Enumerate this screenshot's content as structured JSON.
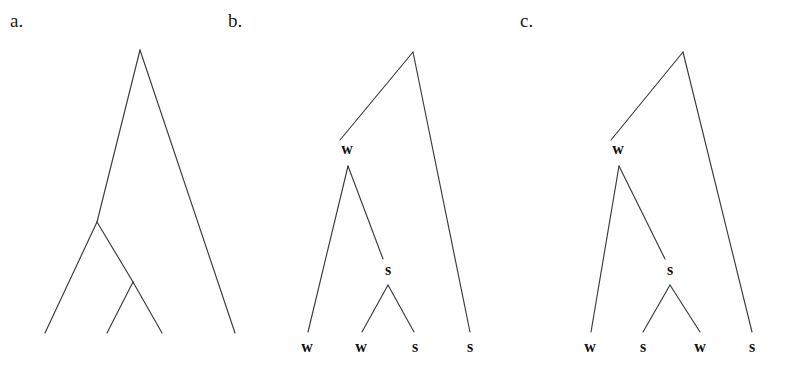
{
  "figure": {
    "background_color": "#ffffff",
    "line_color": "#3a3a3a",
    "text_color": "#111111",
    "panels": [
      {
        "id": "a",
        "label": "a.",
        "label_x": 10,
        "label_y": 27,
        "description": "unlabeled cladogram with four leaf tips",
        "nodes": [
          {
            "name": "root",
            "x": 140,
            "y": 50,
            "label": ""
          },
          {
            "name": "internal-left",
            "x": 97,
            "y": 222,
            "label": ""
          },
          {
            "name": "internal-lower",
            "x": 133,
            "y": 282,
            "label": ""
          }
        ],
        "leaves": [
          {
            "name": "leaf-1",
            "x": 45,
            "y": 333,
            "label": ""
          },
          {
            "name": "leaf-2",
            "x": 107,
            "y": 333,
            "label": ""
          },
          {
            "name": "leaf-3",
            "x": 162,
            "y": 333,
            "label": ""
          },
          {
            "name": "leaf-4",
            "x": 235,
            "y": 333,
            "label": ""
          }
        ],
        "branches": [
          {
            "name": "root-to-internal-left",
            "x1": 140,
            "y1": 50,
            "x2": 97,
            "y2": 222
          },
          {
            "name": "root-to-leaf-4",
            "x1": 140,
            "y1": 50,
            "x2": 235,
            "y2": 333
          },
          {
            "name": "internal-left-to-leaf-1",
            "x1": 97,
            "y1": 222,
            "x2": 45,
            "y2": 333
          },
          {
            "name": "internal-left-to-internal-lower",
            "x1": 97,
            "y1": 222,
            "x2": 133,
            "y2": 282
          },
          {
            "name": "internal-lower-to-leaf-2",
            "x1": 133,
            "y1": 282,
            "x2": 107,
            "y2": 333
          },
          {
            "name": "internal-lower-to-leaf-3",
            "x1": 133,
            "y1": 282,
            "x2": 162,
            "y2": 333
          }
        ]
      },
      {
        "id": "b",
        "label": "b.",
        "label_x": 228,
        "label_y": 27,
        "description": "cladogram with internal nodes labeled w and s, leaves w w s s",
        "nodes": [
          {
            "name": "root",
            "x": 413,
            "y": 52,
            "label": ""
          },
          {
            "name": "node-w",
            "x": 348,
            "y": 166,
            "label": "w",
            "label_x": 347,
            "label_y": 154
          },
          {
            "name": "node-s",
            "x": 388,
            "y": 285,
            "label": "s",
            "label_x": 388,
            "label_y": 275
          }
        ],
        "leaves": [
          {
            "name": "leaf-1",
            "x": 308,
            "y": 332,
            "label": "w",
            "label_x": 307,
            "label_y": 352
          },
          {
            "name": "leaf-2",
            "x": 362,
            "y": 332,
            "label": "w",
            "label_x": 361,
            "label_y": 352
          },
          {
            "name": "leaf-3",
            "x": 414,
            "y": 332,
            "label": "s",
            "label_x": 415,
            "label_y": 352
          },
          {
            "name": "leaf-4",
            "x": 470,
            "y": 332,
            "label": "s",
            "label_x": 470,
            "label_y": 352
          }
        ],
        "branches": [
          {
            "name": "root-to-node-w",
            "x1": 413,
            "y1": 52,
            "x2": 340,
            "y2": 140
          },
          {
            "name": "root-to-leaf-4",
            "x1": 413,
            "y1": 52,
            "x2": 470,
            "y2": 332
          },
          {
            "name": "node-w-to-leaf-1",
            "x1": 348,
            "y1": 166,
            "x2": 308,
            "y2": 332
          },
          {
            "name": "node-w-to-node-s",
            "x1": 348,
            "y1": 166,
            "x2": 383,
            "y2": 259
          },
          {
            "name": "node-s-to-leaf-2",
            "x1": 388,
            "y1": 285,
            "x2": 362,
            "y2": 332
          },
          {
            "name": "node-s-to-leaf-3",
            "x1": 388,
            "y1": 285,
            "x2": 414,
            "y2": 332
          }
        ]
      },
      {
        "id": "c",
        "label": "c.",
        "label_x": 520,
        "label_y": 27,
        "description": "cladogram with internal nodes labeled w and s, leaves w s w s",
        "nodes": [
          {
            "name": "root",
            "x": 683,
            "y": 52,
            "label": ""
          },
          {
            "name": "node-w",
            "x": 619,
            "y": 166,
            "label": "w",
            "label_x": 618,
            "label_y": 154
          },
          {
            "name": "node-s",
            "x": 670,
            "y": 285,
            "label": "s",
            "label_x": 670,
            "label_y": 275
          }
        ],
        "leaves": [
          {
            "name": "leaf-1",
            "x": 591,
            "y": 332,
            "label": "w",
            "label_x": 590,
            "label_y": 352
          },
          {
            "name": "leaf-2",
            "x": 643,
            "y": 332,
            "label": "s",
            "label_x": 643,
            "label_y": 352
          },
          {
            "name": "leaf-3",
            "x": 700,
            "y": 332,
            "label": "w",
            "label_x": 700,
            "label_y": 352
          },
          {
            "name": "leaf-4",
            "x": 752,
            "y": 332,
            "label": "s",
            "label_x": 752,
            "label_y": 352
          }
        ],
        "branches": [
          {
            "name": "root-to-node-w",
            "x1": 683,
            "y1": 52,
            "x2": 611,
            "y2": 140
          },
          {
            "name": "root-to-leaf-4",
            "x1": 683,
            "y1": 52,
            "x2": 752,
            "y2": 332
          },
          {
            "name": "node-w-to-leaf-1",
            "x1": 619,
            "y1": 166,
            "x2": 591,
            "y2": 332
          },
          {
            "name": "node-w-to-node-s",
            "x1": 619,
            "y1": 166,
            "x2": 665,
            "y2": 259
          },
          {
            "name": "node-s-to-leaf-2",
            "x1": 670,
            "y1": 285,
            "x2": 643,
            "y2": 332
          },
          {
            "name": "node-s-to-leaf-3",
            "x1": 670,
            "y1": 285,
            "x2": 700,
            "y2": 332
          }
        ]
      }
    ]
  }
}
